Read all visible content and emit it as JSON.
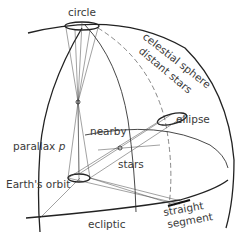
{
  "diagram": {
    "labels": {
      "circle": "circle",
      "celestial_sphere": "celestial sphere",
      "distant_stars": "distant stars",
      "ellipse": "ellipse",
      "nearby": "nearby",
      "parallax": "parallax",
      "parallax_symbol": "p",
      "stars": "stars",
      "earths_orbit": "Earth's orbit",
      "ecliptic": "ecliptic",
      "straight": "straight",
      "segment": "segment"
    },
    "colors": {
      "line": "#333333",
      "text": "#3a3a3a",
      "background": "#ffffff"
    }
  }
}
